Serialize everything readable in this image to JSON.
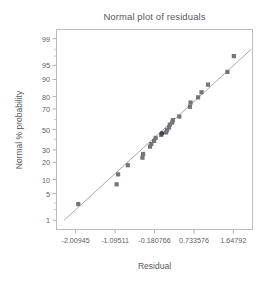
{
  "chart_data": {
    "type": "scatter",
    "title": "Normal plot of residuals",
    "xlabel": "Residual",
    "ylabel": "Normal % probability",
    "grid": false,
    "legend": "none",
    "xlim": [
      -2.466,
      2.1044
    ],
    "ylim": [
      0.5,
      99.5
    ],
    "y_scale": "normal-probability",
    "xticks": [
      -2.00945,
      -1.09511,
      -0.180766,
      0.733576,
      1.64792
    ],
    "xticklabels": [
      "-2.00945",
      "-1.09511",
      "-0.180766",
      "0.733576",
      "1.64792"
    ],
    "yticks": [
      1,
      5,
      10,
      20,
      30,
      50,
      70,
      80,
      90,
      95,
      99
    ],
    "yticklabels": [
      "1",
      "5",
      "10",
      "20",
      "30",
      "50",
      "70",
      "80",
      "90",
      "95",
      "99"
    ],
    "y_minor_ticks": [
      2,
      3,
      40,
      60,
      97,
      98
    ],
    "series": [
      {
        "name": "residual-points",
        "marker": "square",
        "color": "#71757c",
        "points": [
          {
            "x": -1.95,
            "y": 2.8
          },
          {
            "x": -1.06,
            "y": 8.0
          },
          {
            "x": -1.025,
            "y": 12.5
          },
          {
            "x": -0.8,
            "y": 18.0
          },
          {
            "x": -0.46,
            "y": 23.5
          },
          {
            "x": -0.445,
            "y": 26.5
          },
          {
            "x": -0.285,
            "y": 33.0
          },
          {
            "x": -0.255,
            "y": 35.5
          },
          {
            "x": -0.19,
            "y": 38.5
          },
          {
            "x": -0.155,
            "y": 41.5
          },
          {
            "x": -0.025,
            "y": 44.5
          },
          {
            "x": 0.09,
            "y": 47.0
          },
          {
            "x": 0.11,
            "y": 49.5
          },
          {
            "x": 0.155,
            "y": 52.0
          },
          {
            "x": 0.175,
            "y": 55.0
          },
          {
            "x": 0.23,
            "y": 57.0
          },
          {
            "x": 0.245,
            "y": 59.5
          },
          {
            "x": 0.395,
            "y": 63.0
          },
          {
            "x": 0.64,
            "y": 72.0
          },
          {
            "x": 0.655,
            "y": 75.5
          },
          {
            "x": 0.83,
            "y": 79.5
          },
          {
            "x": 0.91,
            "y": 83.0
          },
          {
            "x": 1.06,
            "y": 87.5
          },
          {
            "x": 1.51,
            "y": 93.0
          },
          {
            "x": 1.66,
            "y": 97.0
          }
        ]
      },
      {
        "name": "highlighted-point",
        "marker": "circle",
        "color": "#3f434a",
        "points": [
          {
            "x": -0.01,
            "y": 46.0
          }
        ]
      }
    ],
    "reference_line": {
      "name": "normal-fit-line",
      "color": "#9aa0a7",
      "x1": -2.28,
      "y1": 1.0,
      "x2": 2.06,
      "y2": 98.0
    }
  },
  "chart": {
    "title": "Normal plot of residuals",
    "x_axis_title": "Residual",
    "y_axis_title": "Normal % probability"
  }
}
